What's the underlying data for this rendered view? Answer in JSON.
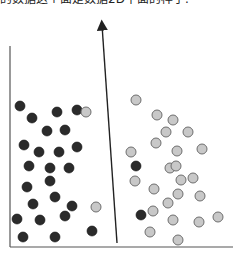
{
  "caption": "的数据这个面是数据2D平面的样子.",
  "diagram": {
    "colors": {
      "dark_fill": "#2b2b2b",
      "light_fill": "#c8c8c8",
      "light_stroke": "#6e6e6e",
      "axis": "#555555",
      "separator": "#222222"
    },
    "frame": {
      "left_x": 10,
      "top_y": 46,
      "bottom_y": 247,
      "right_x": 233
    },
    "separator": {
      "x1": 117,
      "y1": 243,
      "x2": 102,
      "y2": 25
    },
    "dark_points": [
      [
        20,
        106
      ],
      [
        32,
        118
      ],
      [
        57,
        112
      ],
      [
        77,
        110
      ],
      [
        47,
        131
      ],
      [
        65,
        130
      ],
      [
        24,
        145
      ],
      [
        39,
        152
      ],
      [
        59,
        152
      ],
      [
        77,
        147
      ],
      [
        29,
        166
      ],
      [
        50,
        168
      ],
      [
        69,
        168
      ],
      [
        27,
        187
      ],
      [
        50,
        181
      ],
      [
        33,
        204
      ],
      [
        55,
        197
      ],
      [
        72,
        206
      ],
      [
        17,
        219
      ],
      [
        40,
        220
      ],
      [
        65,
        216
      ],
      [
        23,
        237
      ],
      [
        55,
        237
      ],
      [
        92,
        231
      ],
      [
        136,
        166
      ],
      [
        141,
        215
      ]
    ],
    "light_points": [
      [
        86,
        112
      ],
      [
        96,
        207
      ],
      [
        136,
        100
      ],
      [
        157,
        115
      ],
      [
        173,
        120
      ],
      [
        166,
        132
      ],
      [
        188,
        132
      ],
      [
        156,
        143
      ],
      [
        177,
        151
      ],
      [
        202,
        149
      ],
      [
        131,
        152
      ],
      [
        170,
        168
      ],
      [
        181,
        180
      ],
      [
        135,
        181
      ],
      [
        154,
        189
      ],
      [
        178,
        194
      ],
      [
        200,
        196
      ],
      [
        168,
        203
      ],
      [
        153,
        211
      ],
      [
        173,
        220
      ],
      [
        199,
        222
      ],
      [
        218,
        217
      ],
      [
        150,
        232
      ],
      [
        178,
        240
      ],
      [
        193,
        178
      ],
      [
        176,
        166
      ]
    ]
  }
}
